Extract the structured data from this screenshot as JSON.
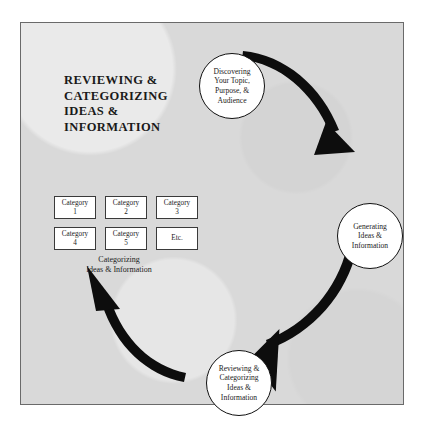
{
  "figure": {
    "title": "REVIEWING &\nCATEGORIZING\nIDEAS &\nINFORMATION",
    "background_color": "#d9d9d9",
    "frame_color": "#6a6a6a",
    "ink_color": "#111111"
  },
  "cycle": {
    "nodes": [
      {
        "id": "discovering",
        "label": "Discovering\nYour Topic,\nPurpose, &\nAudience"
      },
      {
        "id": "generating",
        "label": "Generating\nIdeas &\nInformation"
      },
      {
        "id": "reviewing",
        "label": "Reviewing &\nCategorizing\nIdeas &\nInformation"
      }
    ],
    "arrows": [
      {
        "id": "discovering-to-generating",
        "from": "discovering",
        "to": "generating",
        "direction": "clockwise"
      },
      {
        "id": "generating-to-reviewing",
        "from": "generating",
        "to": "reviewing",
        "direction": "clockwise"
      },
      {
        "id": "reviewing-to-categories",
        "from": "reviewing",
        "to": "category-grid",
        "direction": "clockwise"
      }
    ]
  },
  "category_grid": {
    "caption": "Categorizing\nIdeas & Information",
    "boxes": [
      {
        "label": "Category\n1"
      },
      {
        "label": "Category\n2"
      },
      {
        "label": "Category\n3"
      },
      {
        "label": "Category\n4"
      },
      {
        "label": "Category\n5"
      },
      {
        "label": "Etc."
      }
    ]
  }
}
